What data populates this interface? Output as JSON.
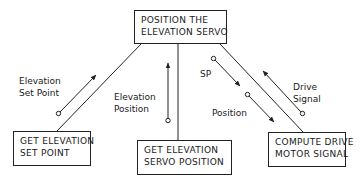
{
  "diagram": {
    "type": "structure-chart",
    "boxes": {
      "top": {
        "lines": [
          "POSITION THE",
          "ELEVATION SERVO"
        ]
      },
      "left": {
        "lines": [
          "GET ELEVATION",
          "SET POINT"
        ]
      },
      "middle": {
        "lines": [
          "GET ELEVATION",
          "SERVO POSITION"
        ]
      },
      "right": {
        "lines": [
          "COMPUTE DRIVE",
          "MOTOR SIGNAL"
        ]
      }
    },
    "flows": {
      "elevation_set_point": {
        "lines": [
          "Elevation",
          "Set Point"
        ],
        "direction": "up",
        "from": "left",
        "to": "top"
      },
      "elevation_position": {
        "lines": [
          "Elevation",
          "Position"
        ],
        "direction": "up",
        "from": "middle",
        "to": "top"
      },
      "sp": {
        "lines": [
          "SP"
        ],
        "direction": "down",
        "from": "top",
        "to": "right"
      },
      "position": {
        "lines": [
          "Position"
        ],
        "direction": "down",
        "from": "top",
        "to": "right"
      },
      "drive_signal": {
        "lines": [
          "Drive",
          "Signal"
        ],
        "direction": "up",
        "from": "right",
        "to": "top"
      }
    },
    "colors": {
      "stroke": "#222222",
      "background": "#ffffff"
    }
  }
}
